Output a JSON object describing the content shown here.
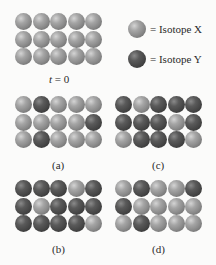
{
  "legend": {
    "x_label": "= Isotope X",
    "y_label": "= Isotope Y",
    "colors": {
      "X": "#8a8a8a",
      "Y": "#474747"
    }
  },
  "panels": {
    "t0": {
      "label_var": "t",
      "label_eq": " = ",
      "label_num": "0",
      "rows": [
        [
          "X",
          "X",
          "X",
          "X",
          "X"
        ],
        [
          "X",
          "X",
          "X",
          "X",
          "X"
        ],
        [
          "X",
          "X",
          "X",
          "X",
          "X"
        ]
      ]
    },
    "a": {
      "label": "(a)",
      "rows": [
        [
          "X",
          "Y",
          "X",
          "X",
          "X"
        ],
        [
          "X",
          "X",
          "X",
          "X",
          "Y"
        ],
        [
          "X",
          "Y",
          "X",
          "X",
          "X"
        ]
      ]
    },
    "b": {
      "label": "(b)",
      "rows": [
        [
          "Y",
          "Y",
          "Y",
          "X",
          "Y"
        ],
        [
          "Y",
          "X",
          "Y",
          "Y",
          "Y"
        ],
        [
          "Y",
          "Y",
          "Y",
          "Y",
          "X"
        ]
      ]
    },
    "c": {
      "label": "(c)",
      "rows": [
        [
          "Y",
          "X",
          "Y",
          "Y",
          "Y"
        ],
        [
          "Y",
          "Y",
          "Y",
          "X",
          "Y"
        ],
        [
          "X",
          "Y",
          "Y",
          "Y",
          "X"
        ]
      ]
    },
    "d": {
      "label": "(d)",
      "rows": [
        [
          "X",
          "Y",
          "X",
          "X",
          "Y"
        ],
        [
          "Y",
          "X",
          "X",
          "X",
          "X"
        ],
        [
          "X",
          "Y",
          "X",
          "X",
          "X"
        ]
      ]
    }
  }
}
